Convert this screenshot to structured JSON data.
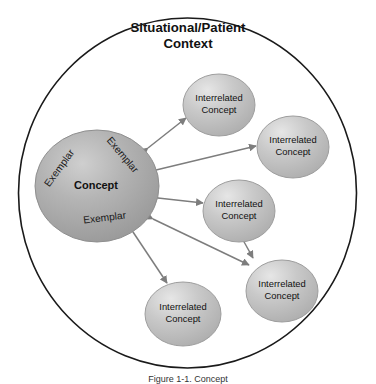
{
  "figure": {
    "title_line1": "Situational/Patient",
    "title_line2": "Context",
    "background_color": "#ffffff",
    "outer_circle": {
      "stroke_color": "#1a1a1a",
      "fill_color": "#ffffff"
    }
  },
  "central_node": {
    "label": "Concept",
    "fill_color": "#a9a9a9",
    "stroke_color": "#8a8a8a",
    "exemplars": [
      {
        "label": "Exemplar",
        "position": "upper-left"
      },
      {
        "label": "Exemplar",
        "position": "upper-right"
      },
      {
        "label": "Exemplar",
        "position": "bottom"
      }
    ]
  },
  "interrelated_nodes": [
    {
      "line1": "Interrelated",
      "line2": "Concept",
      "position": "top"
    },
    {
      "line1": "Interrelated",
      "line2": "Concept",
      "position": "upper-right"
    },
    {
      "line1": "Interrelated",
      "line2": "Concept",
      "position": "middle-right"
    },
    {
      "line1": "Interrelated",
      "line2": "Concept",
      "position": "lower-right"
    },
    {
      "line1": "Interrelated",
      "line2": "Concept",
      "position": "bottom"
    }
  ],
  "node_style": {
    "fill_color": "#c2c2c2",
    "stroke_color": "#9a9a9a",
    "highlight_color": "#e4e4e4"
  },
  "connectors": {
    "color": "#7d7d7d",
    "style": "double-headed-arrow",
    "count": 6
  },
  "caption": {
    "text": "Figure 1-1. Concept"
  }
}
